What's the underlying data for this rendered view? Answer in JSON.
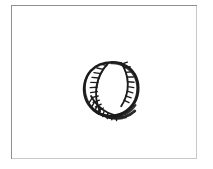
{
  "canvas": {
    "width": 213,
    "height": 169,
    "background_color": "#ffffff",
    "description": "Scanned black-and-white line drawing of a baseball inside a thin rectangular frame"
  },
  "frame": {
    "name": "picture-frame-border",
    "x": 11,
    "y": 5,
    "width": 186,
    "height": 154,
    "border_color": "#8f8f8f",
    "border_width": 1,
    "fill_color": "#ffffff"
  },
  "drawing": {
    "subject": "baseball",
    "style": "hand-drawn ink sketch",
    "stroke_color": "#1c1c1c",
    "fill_color": "#ffffff",
    "center_x": 100,
    "center_y": 85,
    "diameter": 56,
    "parts": [
      {
        "name": "ball-outline",
        "description": "thick irregular circular ink outline of the ball"
      },
      {
        "name": "left-seam",
        "description": "curved seam arc along the left side, bulging toward the center"
      },
      {
        "name": "left-seam-stitches",
        "description": "row of short hatch strokes crossing the left seam",
        "count": 11
      },
      {
        "name": "right-seam",
        "description": "curved seam arc along the upper right side"
      },
      {
        "name": "right-seam-stitches",
        "description": "row of short hatch strokes crossing the right seam",
        "count": 9
      },
      {
        "name": "lower-left-seam",
        "description": "second seam arc sweeping across the lower left of the ball"
      },
      {
        "name": "lower-left-stitches",
        "description": "short hatch strokes along the lower-left seam",
        "count": 8
      },
      {
        "name": "bottom-shading",
        "description": "dense dark shading along the bottom edge of the ball"
      }
    ]
  }
}
